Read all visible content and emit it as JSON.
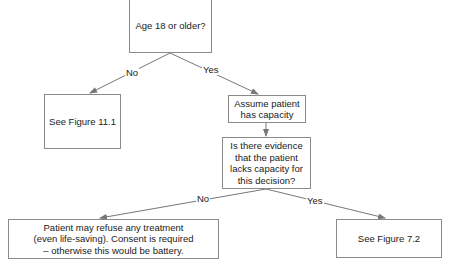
{
  "diagram": {
    "type": "decision-flowchart",
    "nodes": [
      {
        "id": "age",
        "text": "Age 18 or older?"
      },
      {
        "id": "fig11",
        "text": "See Figure 11.1"
      },
      {
        "id": "capacity",
        "text": "Assume patient\nhas capacity"
      },
      {
        "id": "evidence",
        "text": "Is there evidence\nthat the patient\nlacks capacity for\nthis decision?"
      },
      {
        "id": "refuse",
        "text": "Patient may refuse any treatment\n(even life-saving). Consent is required\n– otherwise this would be battery."
      },
      {
        "id": "fig72",
        "text": "See Figure 7.2"
      }
    ],
    "edges": [
      {
        "from": "age",
        "to": "fig11",
        "label": "No"
      },
      {
        "from": "age",
        "to": "capacity",
        "label": "Yes"
      },
      {
        "from": "capacity",
        "to": "evidence",
        "label": ""
      },
      {
        "from": "evidence",
        "to": "refuse",
        "label": "No"
      },
      {
        "from": "evidence",
        "to": "fig72",
        "label": "Yes"
      }
    ]
  },
  "colors": {
    "line": "#777777",
    "border": "#8a8a8a",
    "text": "#1a1a1a",
    "background": "#ffffff"
  }
}
